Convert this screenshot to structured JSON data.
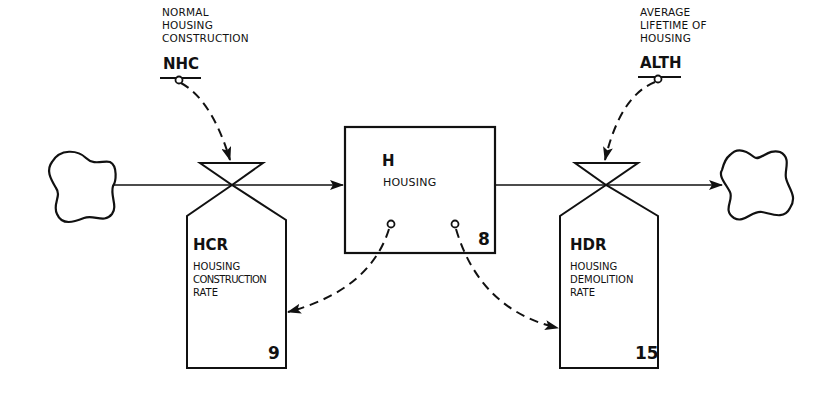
{
  "diagram": {
    "type": "system-dynamics-flow-diagram",
    "auxiliaries": [
      {
        "id": "nhc",
        "description_lines": [
          "NORMAL",
          "HOUSING",
          "CONSTRUCTION"
        ],
        "code": "NHC"
      },
      {
        "id": "alth",
        "description_lines": [
          "AVERAGE",
          "LIFETIME OF",
          "HOUSING"
        ],
        "code": "ALTH"
      }
    ],
    "level": {
      "code": "H",
      "name": "HOUSING",
      "equation_number": "8"
    },
    "rates": [
      {
        "code": "HCR",
        "name_lines": [
          "HOUSING",
          "CONSTRUCTION",
          "RATE"
        ],
        "equation_number": "9"
      },
      {
        "code": "HDR",
        "name_lines": [
          "HOUSING",
          "DEMOLITION",
          "RATE"
        ],
        "equation_number": "15"
      }
    ],
    "sources_sinks": [
      "source-cloud",
      "sink-cloud"
    ],
    "flows": [
      {
        "from": "source-cloud",
        "to": "H",
        "via": "HCR"
      },
      {
        "from": "H",
        "to": "sink-cloud",
        "via": "HDR"
      }
    ],
    "info_links": [
      {
        "from": "NHC",
        "to": "HCR"
      },
      {
        "from": "ALTH",
        "to": "HDR"
      },
      {
        "from": "H",
        "to": "HCR"
      },
      {
        "from": "H",
        "to": "HDR"
      }
    ],
    "colors": {
      "ink": "#111111",
      "background": "#ffffff"
    }
  }
}
